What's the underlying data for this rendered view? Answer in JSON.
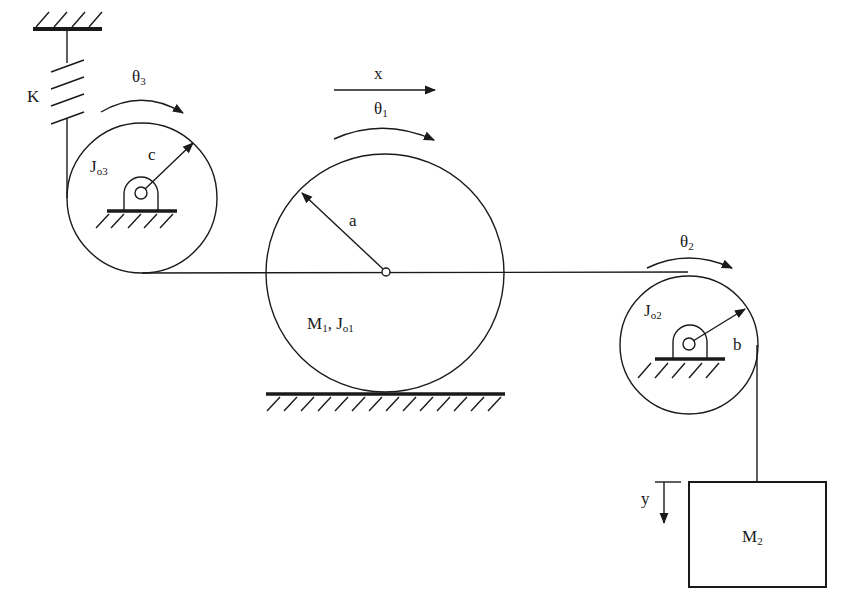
{
  "diagram": {
    "type": "mechanical-system",
    "stroke_color": "#1a1a1a",
    "background": "#ffffff",
    "components": {
      "spring": {
        "label": "K"
      },
      "left_pulley": {
        "inertia_label": "J",
        "inertia_sub": "o3",
        "radius_label": "c",
        "rotation_label": "θ",
        "rotation_sub": "3"
      },
      "rolling_disk": {
        "mass_label": "M",
        "mass_sub": "1",
        "sep": ", ",
        "inertia_label": "J",
        "inertia_sub": "o1",
        "radius_label": "a",
        "rotation_label": "θ",
        "rotation_sub": "1",
        "translation_label": "x"
      },
      "right_pulley": {
        "inertia_label": "J",
        "inertia_sub": "o2",
        "radius_label": "b",
        "rotation_label": "θ",
        "rotation_sub": "2"
      },
      "hanging_mass": {
        "mass_label": "M",
        "mass_sub": "2",
        "displacement_label": "y"
      }
    }
  }
}
